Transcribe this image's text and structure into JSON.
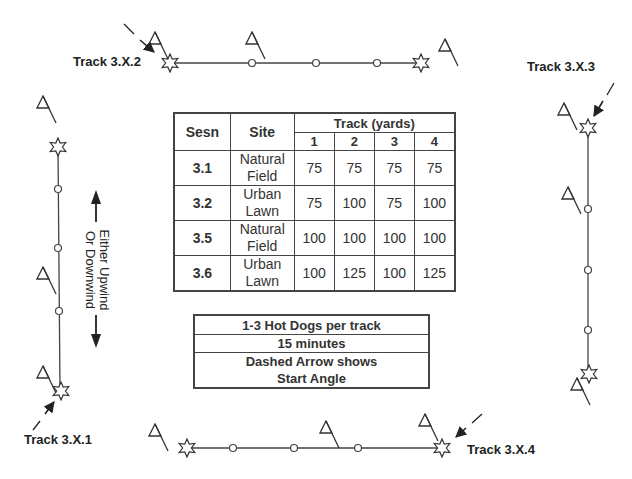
{
  "tracks": [
    {
      "id": "3.X.1",
      "label": "Track 3.X.1"
    },
    {
      "id": "3.X.2",
      "label": "Track 3.X.2"
    },
    {
      "id": "3.X.3",
      "label": "Track 3.X.3"
    },
    {
      "id": "3.X.4",
      "label": "Track 3.X.4"
    }
  ],
  "wind_note": {
    "line1": "Either Upwind",
    "line2": "Or Downwind"
  },
  "schedule_table": {
    "headers": {
      "sesn": "Sesn",
      "site": "Site",
      "track_group": "Track (yards)",
      "track_numbers": [
        "1",
        "2",
        "3",
        "4"
      ]
    },
    "rows": [
      {
        "sesn": "3.1",
        "site_line1": "Natural",
        "site_line2": "Field",
        "values": [
          "75",
          "75",
          "75",
          "75"
        ]
      },
      {
        "sesn": "3.2",
        "site_line1": "Urban",
        "site_line2": "Lawn",
        "values": [
          "75",
          "100",
          "75",
          "100"
        ]
      },
      {
        "sesn": "3.5",
        "site_line1": "Natural",
        "site_line2": "Field",
        "values": [
          "100",
          "100",
          "100",
          "100"
        ]
      },
      {
        "sesn": "3.6",
        "site_line1": "Urban",
        "site_line2": "Lawn",
        "values": [
          "100",
          "125",
          "100",
          "125"
        ]
      }
    ]
  },
  "notes": {
    "line1": "1-3 Hot Dogs per track",
    "line2": "15 minutes",
    "line3a": "Dashed Arrow shows",
    "line3b": "Start Angle"
  },
  "icons": {
    "start": "star-icon",
    "article": "circle-icon",
    "flag": "flag-icon",
    "start_angle": "dashed-arrow-icon",
    "wind_direction": "double-arrow-icon"
  },
  "colors": {
    "line": "#444444",
    "text": "#222222",
    "background": "#ffffff"
  }
}
